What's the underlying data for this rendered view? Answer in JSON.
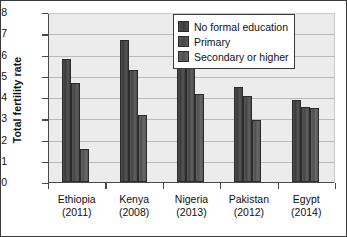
{
  "chart_data": {
    "type": "bar",
    "title": "",
    "xlabel": "",
    "ylabel": "Total fertility rate",
    "ylim": [
      0,
      8
    ],
    "yticks": [
      "0",
      "1",
      "2",
      "3",
      "4",
      "5",
      "6",
      "7",
      "8"
    ],
    "grid": "horizontal",
    "legend_position": "top-right-inside",
    "categories": [
      "Ethiopia\n(2011)",
      "Kenya\n(2008)",
      "Nigeria\n(2013)",
      "Pakistan\n(2012)",
      "Egypt\n(2014)"
    ],
    "category_lines": [
      {
        "name": "Ethiopia",
        "year": "(2011)"
      },
      {
        "name": "Kenya",
        "year": "(2008)"
      },
      {
        "name": "Nigeria",
        "year": "(2013)"
      },
      {
        "name": "Pakistan",
        "year": "(2012)"
      },
      {
        "name": "Egypt",
        "year": "(2014)"
      }
    ],
    "series": [
      {
        "name": "No formal education",
        "color": "#444444",
        "values": [
          5.8,
          6.7,
          6.95,
          4.45,
          3.85
        ]
      },
      {
        "name": "Primary",
        "color": "#4f4f4f",
        "values": [
          4.65,
          5.25,
          6.05,
          4.05,
          3.55
        ]
      },
      {
        "name": "Secondary or higher",
        "color": "#5c5c5c",
        "values": [
          1.55,
          3.15,
          4.15,
          2.9,
          3.5
        ]
      }
    ]
  },
  "legend": {
    "items": [
      {
        "label": "No formal education"
      },
      {
        "label": "Primary"
      },
      {
        "label": "Secondary or higher"
      }
    ]
  }
}
